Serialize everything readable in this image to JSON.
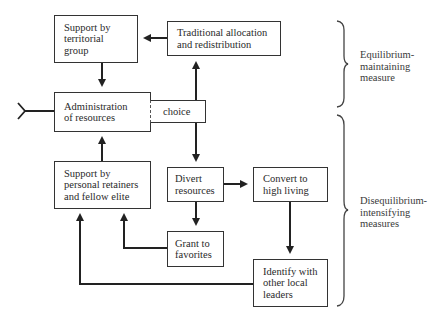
{
  "diagram": {
    "nodes": {
      "territorial": {
        "lines": [
          "Support by",
          "territorial",
          "group"
        ]
      },
      "traditional": {
        "lines": [
          "Traditional allocation",
          "and redistribution"
        ]
      },
      "administration": {
        "lines": [
          "Administration",
          "of resources"
        ]
      },
      "choice": {
        "lines": [
          "choice"
        ]
      },
      "retainers": {
        "lines": [
          "Support by",
          "personal retainers",
          "and fellow elite"
        ]
      },
      "divert": {
        "lines": [
          "Divert",
          "resources"
        ]
      },
      "convert": {
        "lines": [
          "Convert to",
          "high living"
        ]
      },
      "grant": {
        "lines": [
          "Grant to",
          "favorites"
        ]
      },
      "identify": {
        "lines": [
          "Identify with",
          "other local",
          "leaders"
        ]
      }
    },
    "groups": {
      "equilibrium": {
        "lines": [
          "Equilibrium-",
          "maintaining",
          "measure"
        ]
      },
      "disequilibrium": {
        "lines": [
          "Disequilibrium-",
          "intensifying",
          "measures"
        ]
      }
    },
    "edges": [
      {
        "from": "traditional",
        "to": "territorial"
      },
      {
        "from": "territorial",
        "to": "administration"
      },
      {
        "from": "choice",
        "to": "traditional"
      },
      {
        "from": "choice",
        "to": "divert"
      },
      {
        "from": "retainers",
        "to": "administration"
      },
      {
        "from": "divert",
        "to": "convert"
      },
      {
        "from": "divert",
        "to": "grant"
      },
      {
        "from": "grant",
        "to": "retainers"
      },
      {
        "from": "convert",
        "to": "identify"
      },
      {
        "from": "identify",
        "to": "retainers"
      }
    ],
    "line_color": "#222222"
  }
}
